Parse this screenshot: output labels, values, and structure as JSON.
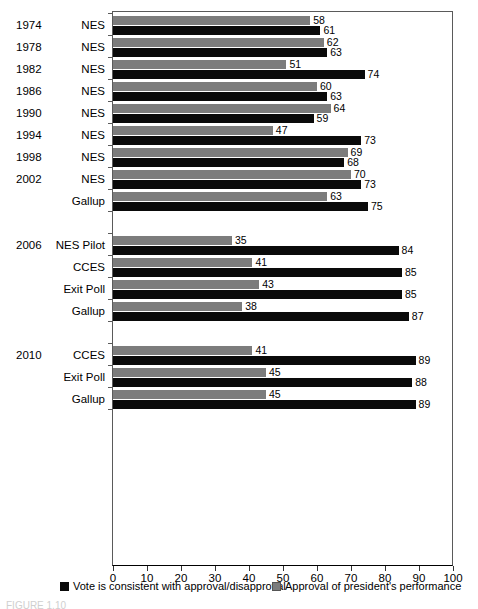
{
  "chart_data": {
    "type": "bar",
    "orientation": "horizontal",
    "title": "",
    "xlabel": "",
    "ylabel": "",
    "xlim": [
      0,
      100
    ],
    "xticks": [
      0,
      10,
      20,
      30,
      40,
      50,
      60,
      70,
      80,
      90,
      100
    ],
    "grid": false,
    "legend_position": "bottom",
    "colors": {
      "black": "#0a0a0a",
      "gray": "#7c7c7c"
    },
    "series": [
      {
        "name": "Vote is consistent with approval/disapproval",
        "key": "vote",
        "color": "#0a0a0a"
      },
      {
        "name": "Approval of president's performance",
        "key": "approval",
        "color": "#7c7c7c"
      }
    ],
    "groups": [
      {
        "gap_before": false,
        "rows": [
          {
            "year": "1974",
            "survey": "NES",
            "approval": 58,
            "vote": 61
          },
          {
            "year": "1978",
            "survey": "NES",
            "approval": 62,
            "vote": 63
          },
          {
            "year": "1982",
            "survey": "NES",
            "approval": 51,
            "vote": 74
          },
          {
            "year": "1986",
            "survey": "NES",
            "approval": 60,
            "vote": 63
          },
          {
            "year": "1990",
            "survey": "NES",
            "approval": 64,
            "vote": 59
          },
          {
            "year": "1994",
            "survey": "NES",
            "approval": 47,
            "vote": 73
          },
          {
            "year": "1998",
            "survey": "NES",
            "approval": 69,
            "vote": 68
          },
          {
            "year": "2002",
            "survey": "NES",
            "approval": 70,
            "vote": 73
          },
          {
            "year": "",
            "survey": "Gallup",
            "approval": 63,
            "vote": 75
          }
        ]
      },
      {
        "gap_before": true,
        "rows": [
          {
            "year": "2006",
            "survey": "NES Pilot",
            "approval": 35,
            "vote": 84
          },
          {
            "year": "",
            "survey": "CCES",
            "approval": 41,
            "vote": 85
          },
          {
            "year": "",
            "survey": "Exit Poll",
            "approval": 43,
            "vote": 85
          },
          {
            "year": "",
            "survey": "Gallup",
            "approval": 38,
            "vote": 87
          }
        ]
      },
      {
        "gap_before": true,
        "rows": [
          {
            "year": "2010",
            "survey": "CCES",
            "approval": 41,
            "vote": 89
          },
          {
            "year": "",
            "survey": "Exit Poll",
            "approval": 45,
            "vote": 88
          },
          {
            "year": "",
            "survey": "Gallup",
            "approval": 45,
            "vote": 89
          }
        ]
      }
    ]
  },
  "legend": {
    "items": [
      {
        "label": "Vote is consistent with approval/disapproval",
        "swatch": "black"
      },
      {
        "label": "Approval of president's performance",
        "swatch": "gray"
      }
    ]
  },
  "caption": {
    "text": "FIGURE 1.10"
  }
}
